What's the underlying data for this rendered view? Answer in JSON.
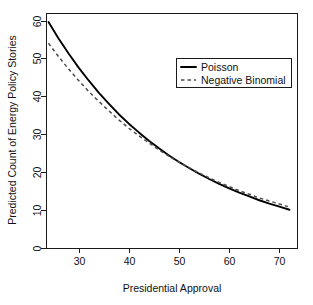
{
  "chart_data": {
    "type": "line",
    "title": "",
    "xlabel": "Presidential Approval",
    "ylabel": "Predicted Count of Energy Policy Stories",
    "xlim": [
      23.5,
      73.5
    ],
    "ylim": [
      0,
      62
    ],
    "xticks": [
      30,
      40,
      50,
      60,
      70
    ],
    "yticks": [
      0,
      10,
      20,
      30,
      40,
      50,
      60
    ],
    "grid": false,
    "legend_position": "top-right",
    "x": [
      24,
      26,
      28,
      30,
      32,
      34,
      36,
      38,
      40,
      42,
      44,
      46,
      48,
      50,
      52,
      54,
      56,
      58,
      60,
      62,
      64,
      66,
      68,
      70,
      72
    ],
    "series": [
      {
        "name": "Poisson",
        "style": "solid",
        "color": "#000000",
        "values": [
          59.6,
          55.3,
          51.3,
          47.6,
          44.2,
          41.0,
          38.1,
          35.3,
          32.8,
          30.5,
          28.3,
          26.3,
          24.4,
          22.7,
          21.1,
          19.6,
          18.2,
          16.9,
          15.7,
          14.6,
          13.6,
          12.6,
          11.7,
          10.9,
          10.1
        ]
      },
      {
        "name": "Negative Binomial",
        "style": "dashed",
        "color": "#4d4d4d",
        "values": [
          54.0,
          50.5,
          47.2,
          44.2,
          41.3,
          38.7,
          36.2,
          33.8,
          31.6,
          29.6,
          27.7,
          25.9,
          24.2,
          22.6,
          21.2,
          19.8,
          18.5,
          17.3,
          16.2,
          15.1,
          14.2,
          13.2,
          12.4,
          11.6,
          10.8
        ]
      }
    ],
    "legend": [
      {
        "label": "Poisson",
        "style": "solid"
      },
      {
        "label": "Negative Binomial",
        "style": "dashed"
      }
    ]
  },
  "plot_box": {
    "left": 46,
    "top": 13,
    "right": 297,
    "bottom": 248
  }
}
